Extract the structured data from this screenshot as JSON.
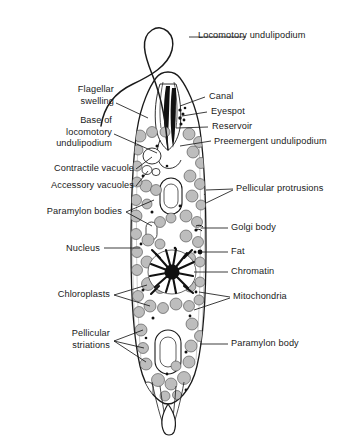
{
  "figure": {
    "organism": "Euglena",
    "style": "line drawing, black ink on white",
    "background_color": "#ffffff",
    "ink_color": "#1a1a1a",
    "organelle_fill": "#b9b9b9",
    "dark_fill": "#111111"
  },
  "labels": {
    "locomotory_undulipodium": "Locomotory undulipodium",
    "flagellar_swelling": "Flagellar\nswelling",
    "base_of_locomotory_undulipodium": "Base of\nlocomotory\nundulipodium",
    "contractile_vacuole": "Contractile vacuole",
    "accessory_vacuoles": "Accessory vacuoles",
    "paramylon_bodies": "Paramylon bodies",
    "nucleus": "Nucleus",
    "chloroplasts": "Chloroplasts",
    "pellicular_striations": "Pellicular\nstriations",
    "canal": "Canal",
    "eyespot": "Eyespot",
    "reservoir": "Reservoir",
    "preemergent_undulipodium": "Preemergent undulipodium",
    "pellicular_protrusions": "Pellicular protrusions",
    "golgi_body": "Golgi body",
    "fat": "Fat",
    "chromatin": "Chromatin",
    "mitochondria": "Mitochondria",
    "paramylon_body": "Paramylon body"
  }
}
